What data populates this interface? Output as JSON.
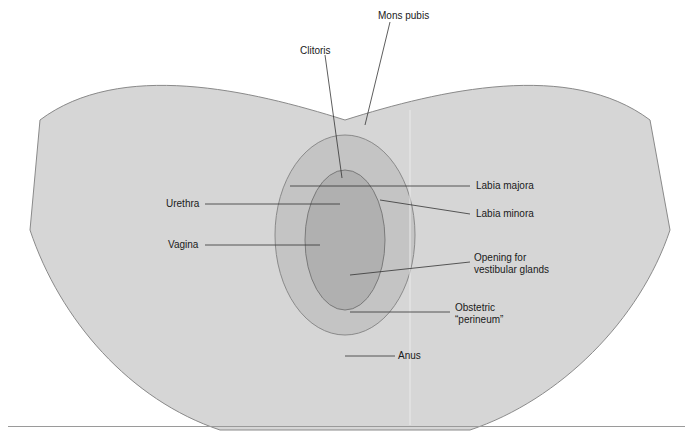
{
  "figure": {
    "type": "anatomical-diagram",
    "labels": [
      {
        "id": "mons-pubis",
        "text": "Mons pubis",
        "x": 378,
        "y": 10
      },
      {
        "id": "clitoris",
        "text": "Clitoris",
        "x": 300,
        "y": 45
      },
      {
        "id": "labia-majora",
        "text": "Labia majora",
        "x": 476,
        "y": 182
      },
      {
        "id": "urethra",
        "text": "Urethra",
        "x": 166,
        "y": 199
      },
      {
        "id": "labia-minora",
        "text": "Labia minora",
        "x": 476,
        "y": 210
      },
      {
        "id": "vagina",
        "text": "Vagina",
        "x": 168,
        "y": 240
      },
      {
        "id": "vestibular-glands",
        "text": "Opening for vestibular glands",
        "x": 474,
        "y": 254
      },
      {
        "id": "obstetric-perineum",
        "text": "Obstetric “perineum”",
        "x": 455,
        "y": 305
      },
      {
        "id": "anus",
        "text": "Anus",
        "x": 398,
        "y": 352
      }
    ]
  }
}
